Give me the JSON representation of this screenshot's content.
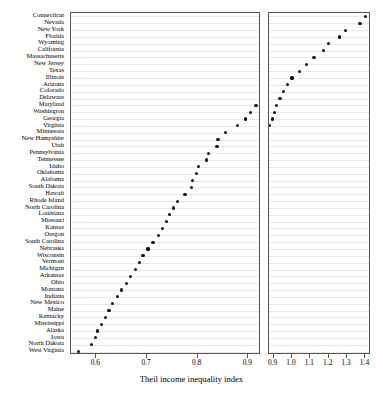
{
  "chart_data": {
    "type": "scatter",
    "subtype": "cleveland-dot-plot",
    "title": "",
    "xlabel": "Theil income inequality index",
    "ylabel": "",
    "grid": true,
    "legend": null,
    "panels": [
      {
        "name": "left",
        "xlim": [
          0.55,
          0.925
        ],
        "ticks": [
          0.6,
          0.7,
          0.8,
          0.9
        ],
        "ticklabels": [
          "0.6",
          "0.7",
          "0.8",
          "0.9"
        ]
      },
      {
        "name": "right",
        "xlim": [
          0.875,
          1.43
        ],
        "ticks": [
          0.9,
          1.0,
          1.1,
          1.2,
          1.3,
          1.4
        ],
        "ticklabels": [
          "0.9",
          "1.0",
          "1.1",
          "1.2",
          "1.3",
          "1.4"
        ]
      }
    ],
    "categories": [
      "Connecticut",
      "Nevada",
      "New York",
      "Florida",
      "Wyoming",
      "California",
      "Massachusetts",
      "New Jersey",
      "Texas",
      "Illinois",
      "Arizona",
      "Colorado",
      "Delaware",
      "Maryland",
      "Washington",
      "Georgia",
      "Virginia",
      "Minnesota",
      "New Hampshire",
      "Utah",
      "Pennsylvania",
      "Tennessee",
      "Idaho",
      "Oklahoma",
      "Alabama",
      "South Dakota",
      "Hawaii",
      "Rhode Island",
      "North Carolina",
      "Louisiana",
      "Missouri",
      "Kansas",
      "Oregon",
      "South Carolina",
      "Nebraska",
      "Wisconsin",
      "Vermont",
      "Michigan",
      "Arkansas",
      "Ohio",
      "Montana",
      "Indiana",
      "New Mexico",
      "Maine",
      "Kentucky",
      "Mississippi",
      "Alaska",
      "Iowa",
      "North Dakota",
      "West Virginia"
    ],
    "values": [
      1.4,
      1.37,
      1.29,
      1.26,
      1.2,
      1.17,
      1.12,
      1.08,
      1.04,
      1.0,
      0.975,
      0.955,
      0.935,
      0.915,
      0.905,
      0.895,
      0.878,
      0.855,
      0.84,
      0.838,
      0.822,
      0.818,
      0.802,
      0.798,
      0.79,
      0.788,
      0.775,
      0.76,
      0.752,
      0.745,
      0.738,
      0.73,
      0.722,
      0.712,
      0.702,
      0.692,
      0.685,
      0.678,
      0.668,
      0.66,
      0.65,
      0.642,
      0.632,
      0.625,
      0.618,
      0.61,
      0.602,
      0.598,
      0.59,
      0.565
    ]
  }
}
